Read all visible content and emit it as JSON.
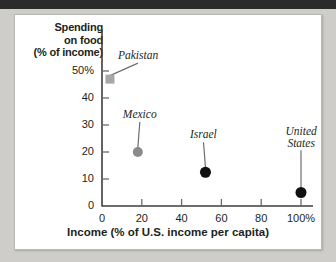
{
  "chart_data": {
    "type": "scatter",
    "title": "",
    "xlabel": "Income (% of U.S. income per capita)",
    "ylabel": "Spending on food (% of income)",
    "ylabel_lines": [
      "Spending",
      "on food",
      "(% of income)"
    ],
    "xlim": [
      0,
      110
    ],
    "ylim": [
      0,
      55
    ],
    "grid": false,
    "legend": "none",
    "xticks": [
      {
        "value": 0,
        "label": "0"
      },
      {
        "value": 20,
        "label": "20"
      },
      {
        "value": 40,
        "label": "40"
      },
      {
        "value": 60,
        "label": "60"
      },
      {
        "value": 80,
        "label": "80"
      },
      {
        "value": 100,
        "label": "100%"
      }
    ],
    "yticks": [
      {
        "value": 50,
        "label": "50%"
      },
      {
        "value": 40,
        "label": "40"
      },
      {
        "value": 30,
        "label": "30"
      },
      {
        "value": 20,
        "label": "20"
      },
      {
        "value": 10,
        "label": "10"
      },
      {
        "value": 0,
        "label": "0"
      }
    ],
    "points": [
      {
        "name": "Pakistan",
        "label_lines": [
          "Pakistan"
        ],
        "x": 4,
        "y": 47,
        "color": "#a7a7a7",
        "marker": "square",
        "size": 9,
        "label_dx": 28,
        "label_dy": -22
      },
      {
        "name": "Mexico",
        "label_lines": [
          "Mexico"
        ],
        "x": 18,
        "y": 20,
        "color": "#8a8a8a",
        "marker": "circle",
        "size": 10,
        "label_dx": 2,
        "label_dy": -36
      },
      {
        "name": "Israel",
        "label_lines": [
          "Israel"
        ],
        "x": 52,
        "y": 12.5,
        "color": "#111111",
        "marker": "circle",
        "size": 11,
        "label_dx": -2,
        "label_dy": -36
      },
      {
        "name": "United States",
        "label_lines": [
          "United",
          "States"
        ],
        "x": 100,
        "y": 5,
        "color": "#111111",
        "marker": "circle",
        "size": 11,
        "label_dx": 0,
        "label_dy": -48
      }
    ]
  },
  "axis": {
    "axis_color": "#3d3d3d",
    "tick_color": "#6b6b6b"
  }
}
